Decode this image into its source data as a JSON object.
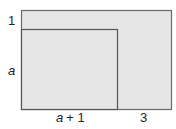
{
  "diagram": {
    "type": "nested-rectangles",
    "outer_rect": {
      "fill": "#e6e6e6",
      "stroke": "#6a6a6a"
    },
    "inner_rect": {
      "fill": "#e6e6e6",
      "stroke": "#555555"
    },
    "labels": {
      "top_gap": "1",
      "inner_height": "a",
      "inner_width_a": "a",
      "inner_width_plus": "+ 1",
      "right_gap": "3"
    }
  }
}
